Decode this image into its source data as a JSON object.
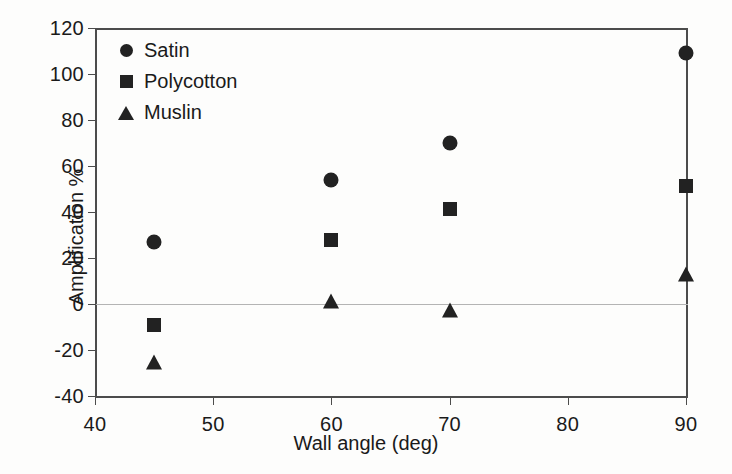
{
  "chart_data": {
    "type": "scatter",
    "title": "",
    "xlabel": "Wall angle (deg)",
    "ylabel": "Amplification %",
    "xlim": [
      40,
      90
    ],
    "ylim": [
      -40,
      120
    ],
    "xticks": [
      40,
      50,
      60,
      70,
      80,
      90
    ],
    "yticks": [
      120,
      100,
      80,
      60,
      40,
      20,
      0,
      -20,
      -40
    ],
    "xtick_labels": [
      "40",
      "50",
      "60",
      "70",
      "80",
      "90"
    ],
    "ytick_labels": [
      "120",
      "100",
      "80",
      "60",
      "40",
      "20",
      "0",
      "-20",
      "-40"
    ],
    "grid": false,
    "zero_line": true,
    "legend_position": "upper left (inside plot)",
    "marker_color": "#222222",
    "axis_color": "#4c4c4c",
    "zero_line_color": "#b4b4b4",
    "series": [
      {
        "name": "Satin",
        "marker": "circle",
        "x": [
          45,
          60,
          70,
          90
        ],
        "values": [
          27,
          54,
          70,
          109
        ]
      },
      {
        "name": "Polycotton",
        "marker": "square",
        "x": [
          45,
          60,
          70,
          90
        ],
        "values": [
          -9,
          28,
          41.5,
          51.5
        ]
      },
      {
        "name": "Muslin",
        "marker": "triangle",
        "x": [
          45,
          60,
          70,
          90
        ],
        "values": [
          -25,
          1.5,
          -2.5,
          13
        ]
      }
    ]
  }
}
